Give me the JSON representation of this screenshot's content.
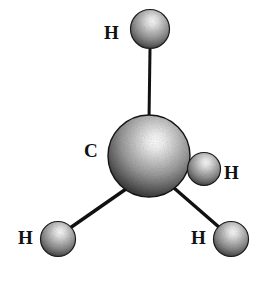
{
  "figure": {
    "kind": "molecular-model",
    "model_style": "ball-and-stick",
    "molecule_name": "methane",
    "molecular_formula": "CH4",
    "background_color": "#ffffff",
    "render_style": "grayscale halftone / stippled shading"
  },
  "colors": {
    "background": "#ffffff",
    "bond_line": "#111111",
    "label_text": "#111111",
    "sphere_dark": "#2b2b2b",
    "sphere_mid": "#8c8c8c",
    "sphere_light": "#f2f2f2",
    "sphere_outline": "#1a1a1a"
  },
  "atoms": [
    {
      "id": "c-center",
      "element": "C",
      "label": "C",
      "role": "central-atom",
      "cx": 149,
      "cy": 156,
      "r": 41,
      "label_x": 84,
      "label_y": 141
    },
    {
      "id": "h-top",
      "element": "H",
      "label": "H",
      "role": "substituent",
      "cx": 150,
      "cy": 29,
      "r": 19,
      "label_x": 104,
      "label_y": 23
    },
    {
      "id": "h-right",
      "element": "H",
      "label": "H",
      "role": "substituent",
      "cx": 204,
      "cy": 169,
      "r": 16,
      "label_x": 224,
      "label_y": 163
    },
    {
      "id": "h-bottom-left",
      "element": "H",
      "label": "H",
      "role": "substituent",
      "cx": 58,
      "cy": 239,
      "r": 17,
      "label_x": 18,
      "label_y": 228
    },
    {
      "id": "h-bottom-right",
      "element": "H",
      "label": "H",
      "role": "substituent",
      "cx": 231,
      "cy": 239,
      "r": 17,
      "label_x": 191,
      "label_y": 228
    }
  ],
  "bonds": [
    {
      "id": "bond-c-h-top",
      "from": "c-center",
      "to": "h-top",
      "x1": 149,
      "y1": 120,
      "x2": 150,
      "y2": 49,
      "width": 3
    },
    {
      "id": "bond-c-h-right",
      "from": "c-center",
      "to": "h-right",
      "x1": 176,
      "y1": 164,
      "x2": 192,
      "y2": 170,
      "width": 6
    },
    {
      "id": "bond-c-h-bottom-left",
      "from": "c-center",
      "to": "h-bottom-left",
      "x1": 126,
      "y1": 189,
      "x2": 70,
      "y2": 228,
      "width": 3
    },
    {
      "id": "bond-c-h-bottom-right",
      "from": "c-center",
      "to": "h-bottom-right",
      "x1": 174,
      "y1": 188,
      "x2": 220,
      "y2": 228,
      "width": 3
    }
  ]
}
